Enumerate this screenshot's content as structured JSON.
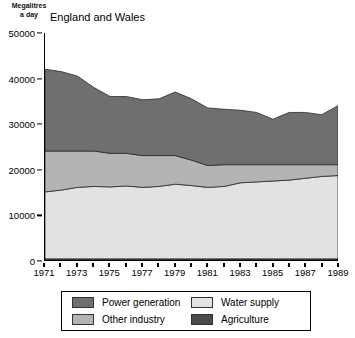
{
  "axis_unit": {
    "line1": "Megalitres",
    "line2": "a day"
  },
  "subtitle": "England and Wales",
  "legend": {
    "items": [
      {
        "label": "Power generation",
        "color": "#6f6f6f",
        "key": "power_generation"
      },
      {
        "label": "Water supply",
        "color": "#e2e2e2",
        "key": "water_supply"
      },
      {
        "label": "Other industry",
        "color": "#b4b4b4",
        "key": "other_industry"
      },
      {
        "label": "Agriculture",
        "color": "#4a4a4a",
        "key": "agriculture"
      }
    ]
  },
  "chart_data": {
    "type": "area",
    "title": "",
    "subtitle": "England and Wales",
    "xlabel": "",
    "ylabel": "Megalitres a day",
    "ylim": [
      0,
      50000
    ],
    "ytick_values": [
      0,
      10000,
      20000,
      30000,
      40000,
      50000
    ],
    "ytick_labels": [
      "0",
      "10000",
      "20000",
      "30000",
      "40000",
      "50000"
    ],
    "xlim": [
      1971,
      1989
    ],
    "x": [
      1971,
      1972,
      1973,
      1974,
      1975,
      1976,
      1977,
      1978,
      1979,
      1980,
      1981,
      1982,
      1983,
      1984,
      1985,
      1986,
      1987,
      1988,
      1989
    ],
    "xtick_values": [
      1971,
      1972,
      1973,
      1974,
      1975,
      1976,
      1977,
      1978,
      1979,
      1980,
      1981,
      1982,
      1983,
      1984,
      1985,
      1986,
      1987,
      1988,
      1989
    ],
    "xtick_labels_shown": [
      "1971",
      "1973",
      "1975",
      "1977",
      "1979",
      "1981",
      "1983",
      "1985",
      "1987",
      "1989"
    ],
    "grid": false,
    "legend_position": "below-axis",
    "stacked": true,
    "stack_order_bottom_to_top": [
      "agriculture",
      "water_supply",
      "other_industry",
      "power_generation"
    ],
    "series": [
      {
        "name": "Agriculture",
        "key": "agriculture",
        "color": "#4a4a4a",
        "values": [
          250,
          250,
          250,
          250,
          250,
          250,
          250,
          250,
          250,
          250,
          250,
          250,
          250,
          250,
          250,
          250,
          250,
          250,
          250
        ]
      },
      {
        "name": "Water supply",
        "key": "water_supply",
        "color": "#e2e2e2",
        "values": [
          14750,
          15150,
          15750,
          15950,
          15850,
          16050,
          15750,
          15950,
          16450,
          16150,
          15750,
          15950,
          16750,
          16950,
          17150,
          17350,
          17750,
          18150,
          18350
        ]
      },
      {
        "name": "Other industry",
        "key": "other_industry",
        "color": "#b4b4b4",
        "values": [
          9000,
          8600,
          8000,
          7800,
          7400,
          7200,
          7000,
          6800,
          6300,
          5600,
          4800,
          4800,
          4000,
          3800,
          3600,
          3400,
          3000,
          2600,
          2400
        ]
      },
      {
        "name": "Power generation",
        "key": "power_generation",
        "color": "#6f6f6f",
        "values": [
          18000,
          17500,
          16500,
          14000,
          12500,
          12500,
          12300,
          12500,
          14000,
          13500,
          12700,
          12200,
          12000,
          11500,
          10000,
          11500,
          11500,
          11000,
          13000
        ]
      }
    ],
    "totals": [
      42000,
      41500,
      40500,
      38000,
      36000,
      36000,
      35300,
      35500,
      37000,
      35500,
      33500,
      33200,
      33000,
      32500,
      31000,
      32500,
      32500,
      32000,
      34000
    ]
  }
}
